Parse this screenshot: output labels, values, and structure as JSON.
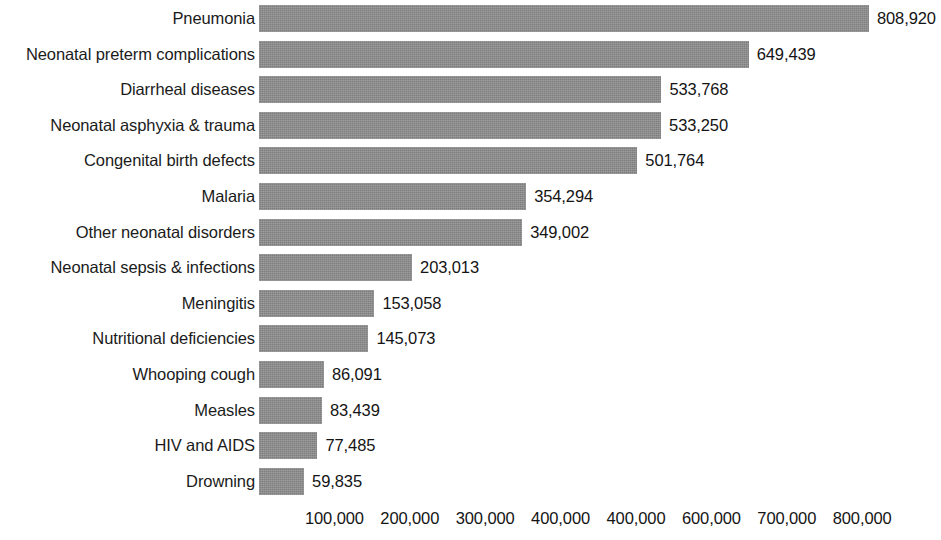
{
  "chart_data": {
    "type": "bar",
    "orientation": "horizontal",
    "title": "",
    "subtitle": "",
    "xlabel": "",
    "ylabel": "",
    "grid": false,
    "legend": null,
    "xlim": [
      0,
      808920
    ],
    "axis_tick_labels": [
      "100,000",
      "200,000",
      "300,000",
      "400,000",
      "400,000",
      "600,000",
      "700,000",
      "800,000"
    ],
    "axis_tick_values": [
      100000,
      200000,
      300000,
      400000,
      500000,
      600000,
      700000,
      800000
    ],
    "categories": [
      "Pneumonia",
      "Neonatal preterm complications",
      "Diarrheal diseases",
      "Neonatal asphyxia & trauma",
      "Congenital birth defects",
      "Malaria",
      "Other neonatal disorders",
      "Neonatal sepsis & infections",
      "Meningitis",
      "Nutritional deficiencies",
      "Whooping cough",
      "Measles",
      "HIV and AIDS",
      "Drowning"
    ],
    "values": [
      808920,
      649439,
      533768,
      533250,
      501764,
      354294,
      349002,
      203013,
      153058,
      145073,
      86091,
      83439,
      77485,
      59835
    ],
    "value_labels": [
      "808,920",
      "649,439",
      "533,768",
      "533,250",
      "501,764",
      "354,294",
      "349,002",
      "203,013",
      "153,058",
      "145,073",
      "86,091",
      "83,439",
      "77,485",
      "59,835"
    ],
    "bar_color": "#8c8c8c",
    "text_color": "#141414",
    "background_color": "#ffffff"
  }
}
